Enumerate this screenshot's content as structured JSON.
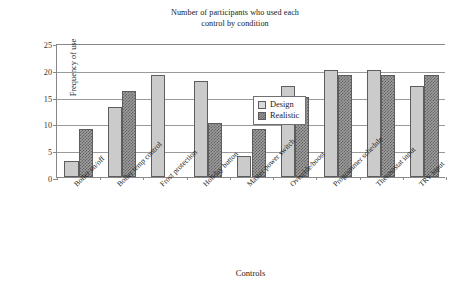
{
  "chart_data": {
    "type": "bar",
    "title": "Number of participants who used each control by condition",
    "title_line1": "Number of participants who used each",
    "title_line2": "control by condition",
    "xlabel": "Controls",
    "ylabel": "Frequency of use",
    "ylim": [
      0,
      25
    ],
    "ytick_labels": [
      "0",
      "5",
      "10",
      "15",
      "20",
      "25"
    ],
    "ytick_values": [
      0,
      5,
      10,
      15,
      20,
      25
    ],
    "grid": "horizontal",
    "legend_position": "upper-center",
    "categories": [
      "Boiler on/off",
      "Boiler temp control",
      "Frost protection",
      "Holiday button",
      "Master power switch",
      "Override/boost",
      "Programmer schedule",
      "Thermostat input",
      "TRV input"
    ],
    "series": [
      {
        "name": "Design",
        "color": "#cbcbcb",
        "values": [
          3,
          13,
          19,
          18,
          4,
          17,
          20,
          20,
          17
        ]
      },
      {
        "name": "Realistic",
        "color": "#9e9e9e",
        "values": [
          9,
          16,
          0,
          10,
          9,
          15,
          19,
          19,
          19
        ]
      }
    ]
  },
  "legend": {
    "entries": [
      {
        "label": "Design",
        "swatch": "design"
      },
      {
        "label": "Realistic",
        "swatch": "realistic"
      }
    ]
  }
}
